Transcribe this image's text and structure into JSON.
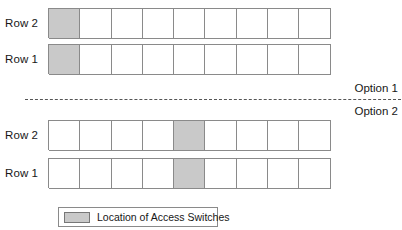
{
  "diagram": {
    "title_hidden": "",
    "columns": 9,
    "shade_color": "#c9c9c9",
    "border_color": "#8a8a8a",
    "options": [
      {
        "caption": "Option 1",
        "rows": [
          {
            "label": "Row 2",
            "shaded_index": 0
          },
          {
            "label": "Row 1",
            "shaded_index": 0
          }
        ]
      },
      {
        "caption": "Option 2",
        "rows": [
          {
            "label": "Row 2",
            "shaded_index": 4
          },
          {
            "label": "Row 1",
            "shaded_index": 4
          }
        ]
      }
    ]
  },
  "legend": {
    "swatch_color": "#c9c9c9",
    "text": "Location of Access Switches"
  }
}
